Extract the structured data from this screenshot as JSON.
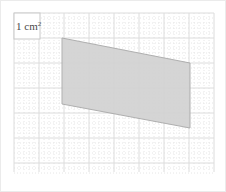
{
  "figure": {
    "background_color": "#ffffff",
    "frame_color": "#ebebeb"
  },
  "grid": {
    "origin_x": 14,
    "origin_y": 13,
    "major_cell_px": 25,
    "minor_divisions": 5,
    "cols": 8,
    "rows": 6,
    "width_px": 200,
    "height_px": 159,
    "major_color": "#dcdcdc",
    "minor_color": "#e6e6e6",
    "minor_style": "dotted",
    "major_style": "solid"
  },
  "unit_label": {
    "value": "1 cm",
    "exponent": "2",
    "full_text": "1 cm²",
    "box_x": 14,
    "box_y": 13,
    "box_width": 26,
    "box_height": 26,
    "box_fill": "#ffffff",
    "box_stroke": "#c8c8c8",
    "text_color": "#4a4a4a"
  },
  "shape": {
    "name": "parallelogram",
    "fill_color": "#d2d2d2",
    "stroke_color": "#a9a9a9",
    "stroke_width": 1,
    "opacity": 0.92,
    "points_attr": "62,38 190,63 190,128 62,104",
    "vertices": [
      {
        "label": "top-left",
        "x": 62,
        "y": 38
      },
      {
        "label": "top-right",
        "x": 190,
        "y": 63
      },
      {
        "label": "bottom-right",
        "x": 190,
        "y": 128
      },
      {
        "label": "bottom-left",
        "x": 62,
        "y": 104
      }
    ],
    "base_cells": 5.1,
    "height_cells": 2.6
  }
}
